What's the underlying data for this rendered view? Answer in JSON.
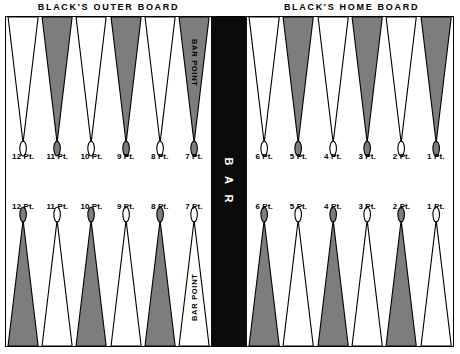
{
  "figure": {
    "bar_label": "B A R",
    "bar_point_caption_top": "BAR POINT",
    "bar_point_caption_bottom": "BAR POINT"
  },
  "headings": {
    "outer_board": "BLACK'S OUTER BOARD",
    "home_board": "BLACK'S HOME BOARD"
  },
  "colors": {
    "shaded_point": "#7d7d7d",
    "open_point": "#ffffff",
    "outline": "#000000",
    "bar_background": "#0b0b0b",
    "bar_text": "#ffffff",
    "page_background": "#ffffff"
  },
  "quadrants": {
    "top_left": {
      "name": "BLACK'S OUTER BOARD",
      "points": [
        {
          "label": "12 Pt.",
          "number": 12,
          "fill": "open"
        },
        {
          "label": "11 Pt.",
          "number": 11,
          "fill": "shaded"
        },
        {
          "label": "10 Pt.",
          "number": 10,
          "fill": "open"
        },
        {
          "label": "9 Pt.",
          "number": 9,
          "fill": "shaded"
        },
        {
          "label": "8 Pt.",
          "number": 8,
          "fill": "open"
        },
        {
          "label": "7 Pt.",
          "number": 7,
          "fill": "shaded",
          "caption": "BAR POINT"
        }
      ]
    },
    "top_right": {
      "name": "BLACK'S HOME BOARD",
      "points": [
        {
          "label": "6 Pt.",
          "number": 6,
          "fill": "open"
        },
        {
          "label": "5 Pt.",
          "number": 5,
          "fill": "shaded"
        },
        {
          "label": "4 Pt.",
          "number": 4,
          "fill": "open"
        },
        {
          "label": "3 Pt.",
          "number": 3,
          "fill": "shaded"
        },
        {
          "label": "2 Pt.",
          "number": 2,
          "fill": "open"
        },
        {
          "label": "1 Pt.",
          "number": 1,
          "fill": "shaded"
        }
      ]
    },
    "bottom_left": {
      "name": "WHITE'S OUTER BOARD",
      "points": [
        {
          "label": "12 Pt.",
          "number": 12,
          "fill": "shaded"
        },
        {
          "label": "11 Pt.",
          "number": 11,
          "fill": "open"
        },
        {
          "label": "10 Pt.",
          "number": 10,
          "fill": "shaded"
        },
        {
          "label": "9 Pt.",
          "number": 9,
          "fill": "open"
        },
        {
          "label": "8 Pt.",
          "number": 8,
          "fill": "shaded"
        },
        {
          "label": "7 Pt.",
          "number": 7,
          "fill": "open",
          "caption": "BAR POINT"
        }
      ]
    },
    "bottom_right": {
      "name": "WHITE'S HOME BOARD",
      "points": [
        {
          "label": "6 Pt.",
          "number": 6,
          "fill": "shaded"
        },
        {
          "label": "5 Pt.",
          "number": 5,
          "fill": "open"
        },
        {
          "label": "4 Pt.",
          "number": 4,
          "fill": "shaded"
        },
        {
          "label": "3 Pt.",
          "number": 3,
          "fill": "open"
        },
        {
          "label": "2 Pt.",
          "number": 2,
          "fill": "shaded"
        },
        {
          "label": "1 Pt.",
          "number": 1,
          "fill": "open"
        }
      ]
    }
  }
}
